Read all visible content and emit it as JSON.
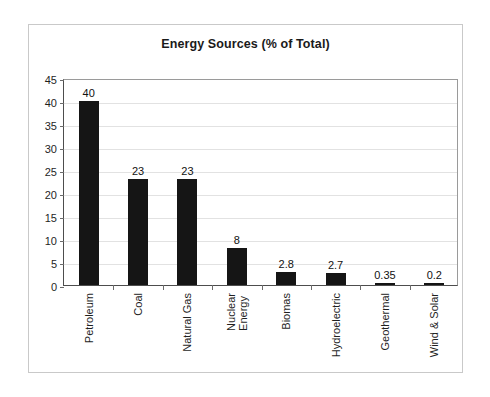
{
  "chart_data": {
    "type": "bar",
    "title": "Energy Sources (% of Total)",
    "xlabel": "",
    "ylabel": "",
    "ylim": [
      0,
      45
    ],
    "ytick_step": 5,
    "yticks": [
      "45",
      "40",
      "35",
      "30",
      "25",
      "20",
      "15",
      "10",
      "5",
      "0"
    ],
    "grid": true,
    "legend": "none",
    "bar_color": "#151515",
    "categories": [
      "Petroleum",
      "Coal",
      "Natural Gas",
      "Nuclear Energy",
      "Biomas",
      "Hydroelectric",
      "Geothermal",
      "Wind & Solar"
    ],
    "category_lines": [
      [
        "Petroleum"
      ],
      [
        "Coal"
      ],
      [
        "Natural Gas"
      ],
      [
        "Nuclear",
        "Energy"
      ],
      [
        "Biomas"
      ],
      [
        "Hydroelectric"
      ],
      [
        "Geothermal"
      ],
      [
        "Wind & Solar"
      ]
    ],
    "values": [
      40,
      23,
      23,
      8,
      2.8,
      2.7,
      0.35,
      0.2
    ],
    "value_labels": [
      "40",
      "23",
      "23",
      "8",
      "2.8",
      "2.7",
      "0.35",
      "0.2"
    ]
  }
}
